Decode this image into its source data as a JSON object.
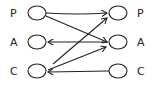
{
  "diagram": {
    "left_nodes": [
      {
        "id": "LP",
        "label": "P",
        "x": 37,
        "y": 13
      },
      {
        "id": "LA",
        "label": "A",
        "x": 37,
        "y": 42
      },
      {
        "id": "LC",
        "label": "C",
        "x": 37,
        "y": 71
      }
    ],
    "right_nodes": [
      {
        "id": "RP",
        "label": "P",
        "x": 118,
        "y": 13
      },
      {
        "id": "RA",
        "label": "A",
        "x": 118,
        "y": 42
      },
      {
        "id": "RC",
        "label": "C",
        "x": 118,
        "y": 71
      }
    ],
    "edges": [
      {
        "from": "LP",
        "to": "RP"
      },
      {
        "from": "LP",
        "to": "RA"
      },
      {
        "from": "RA",
        "to": "LA"
      },
      {
        "from": "LC",
        "to": "RP"
      },
      {
        "from": "LC",
        "to": "RA"
      },
      {
        "from": "RC",
        "to": "LC"
      }
    ],
    "stroke_color": "#222222"
  }
}
